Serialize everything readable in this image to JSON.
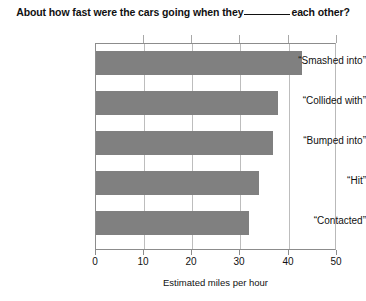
{
  "chart_data": {
    "type": "bar",
    "orientation": "horizontal",
    "title_prefix": "About how fast were the cars going when they",
    "title_suffix": "each other?",
    "categories": [
      "“Smashed into”",
      "“Collided with”",
      "“Bumped into”",
      "“Hit”",
      "“Contacted”"
    ],
    "values": [
      43,
      38,
      37,
      34,
      32
    ],
    "xlabel": "Estimated miles per hour",
    "ylabel": "",
    "xlim": [
      0,
      50
    ],
    "xticks": [
      0,
      10,
      20,
      30,
      40,
      50
    ],
    "xtick_labels": [
      "0",
      "10",
      "20",
      "30",
      "40",
      "50"
    ],
    "grid": "vertical",
    "legend": "none",
    "bar_color": "#808080",
    "gridline_color": "#bdbdbd",
    "axis_color": "#8c8c8c"
  }
}
